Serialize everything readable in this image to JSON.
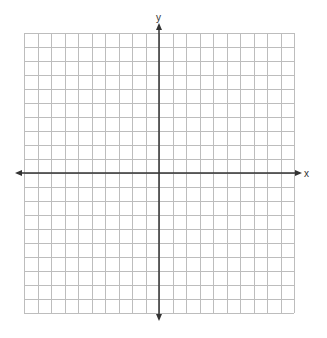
{
  "chart_data": {
    "type": "coordinate-grid",
    "title": "",
    "xlabel": "x",
    "ylabel": "y",
    "grid": true,
    "x_range": [
      -10,
      10
    ],
    "y_range": [
      -10,
      10
    ],
    "x_cells": 20,
    "y_cells": 20,
    "tick_labels": false,
    "arrows": {
      "x_axis": "both-ends",
      "y_axis": "both-ends"
    },
    "points": [],
    "series": []
  },
  "geometry": {
    "grid_left": 24,
    "grid_top": 33,
    "grid_right": 294,
    "grid_bottom": 313,
    "origin_x": 159,
    "origin_y": 173,
    "x_axis_start": 15,
    "x_axis_end": 302,
    "y_axis_start": 23,
    "y_axis_end": 321
  },
  "colors": {
    "background": "#ffffff",
    "grid_line": "#bdbdbd",
    "axis_line": "#333333",
    "label": "#333333"
  },
  "labels": {
    "x_axis": "x",
    "y_axis": "y"
  }
}
